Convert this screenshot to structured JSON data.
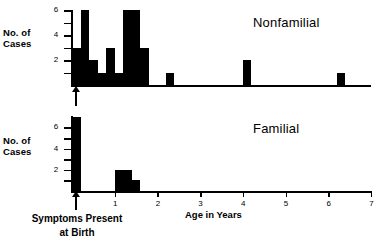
{
  "chart_data": {
    "type": "bar",
    "title": "",
    "xlabel": "Age in Years",
    "ylabel": "No. of Cases",
    "xlim": [
      0,
      7
    ],
    "ylim": [
      0,
      7
    ],
    "xticks": [
      0,
      1,
      2,
      3,
      4,
      5,
      6,
      7
    ],
    "xticklabels": [
      "",
      "1",
      "2",
      "3",
      "4",
      "5",
      "6",
      "7"
    ],
    "yticks": [
      1,
      2,
      3,
      4,
      5,
      6
    ],
    "yticklabels": [
      "",
      "2",
      "",
      "4",
      "",
      "6"
    ],
    "grid": false,
    "legend": "none",
    "bin_width": 0.2,
    "annotation": "Symptoms Present\nat Birth",
    "annotation_x": 0,
    "panels": [
      {
        "name": "Nonfamilial",
        "label": "Nonfamilial",
        "ylabel": "No. of\nCases",
        "bins": [
          0.0,
          0.2,
          0.4,
          0.6,
          0.8,
          1.0,
          1.2,
          1.4,
          1.6,
          1.8,
          2.0,
          2.2,
          2.4,
          2.6,
          2.8,
          3.0,
          3.2,
          3.4,
          3.6,
          3.8,
          4.0,
          4.2,
          4.4,
          4.6,
          4.8,
          5.0,
          5.2,
          5.4,
          5.6,
          5.8,
          6.0,
          6.2,
          6.4,
          6.6,
          6.8
        ],
        "values": [
          3,
          6,
          2,
          1,
          3,
          1,
          6,
          6,
          3,
          0,
          0,
          1,
          0,
          0,
          0,
          0,
          0,
          0,
          0,
          0,
          2,
          0,
          0,
          0,
          0,
          0,
          0,
          0,
          0,
          0,
          0,
          1,
          0,
          0,
          0
        ]
      },
      {
        "name": "Familial",
        "label": "Familial",
        "ylabel": "No. of\nCases",
        "bins": [
          0.0,
          0.2,
          0.4,
          0.6,
          0.8,
          1.0,
          1.2,
          1.4,
          1.6
        ],
        "values": [
          7,
          0,
          0,
          0,
          0,
          2,
          2,
          1,
          0
        ]
      }
    ]
  },
  "axes": {
    "y_label_line1": "No. of",
    "y_label_line2": "Cases",
    "x_title": "Age in Years",
    "y_ticks": [
      {
        "v": 6,
        "label": "6"
      },
      {
        "v": 5,
        "label": ""
      },
      {
        "v": 4,
        "label": "4"
      },
      {
        "v": 3,
        "label": ""
      },
      {
        "v": 2,
        "label": "2"
      },
      {
        "v": 1,
        "label": ""
      }
    ],
    "x_ticks": [
      {
        "v": 1,
        "label": "1"
      },
      {
        "v": 2,
        "label": "2"
      },
      {
        "v": 3,
        "label": "3"
      },
      {
        "v": 4,
        "label": "4"
      },
      {
        "v": 5,
        "label": "5"
      },
      {
        "v": 6,
        "label": "6"
      },
      {
        "v": 7,
        "label": "7"
      }
    ]
  },
  "annotation": {
    "line1": "Symptoms Present",
    "line2": "at Birth",
    "arrow": "up-arrow-icon"
  },
  "colors": {
    "bar": "#000000",
    "axis": "#000000",
    "background": "#ffffff"
  }
}
